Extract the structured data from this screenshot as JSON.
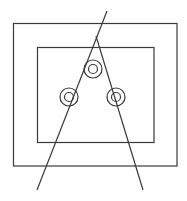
{
  "diagram": {
    "width": 187,
    "height": 201,
    "background": "#ffffff",
    "stroke_color": "#3a3a3a",
    "stroke_width": 1.2,
    "outer_rect": {
      "x": 13.5,
      "y": 23.5,
      "w": 163.5,
      "h": 142.5
    },
    "inner_rect": {
      "x": 37.5,
      "y": 47.5,
      "w": 116.5,
      "h": 95
    },
    "lines": [
      {
        "name": "left-ray",
        "x1": 107,
        "y1": 11,
        "x2": 37,
        "y2": 190
      },
      {
        "name": "right-ray",
        "x1": 96,
        "y1": 36,
        "x2": 143,
        "y2": 190
      }
    ],
    "circles": [
      {
        "name": "top-circle",
        "cx": 93,
        "cy": 69,
        "r_outer": 9,
        "r_inner": 4.5
      },
      {
        "name": "left-circle",
        "cx": 69,
        "cy": 97,
        "r_outer": 9,
        "r_inner": 4.5
      },
      {
        "name": "right-circle",
        "cx": 116,
        "cy": 97,
        "r_outer": 9,
        "r_inner": 4.5
      }
    ]
  }
}
